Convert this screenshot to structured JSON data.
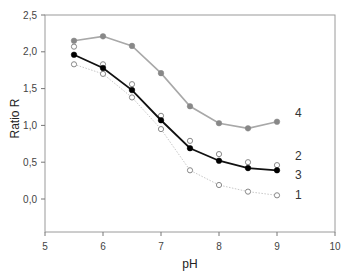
{
  "chart_data": {
    "type": "line",
    "title": "",
    "xlabel": "pH",
    "ylabel": "Ratio R",
    "xlim": [
      5,
      10
    ],
    "ylim": [
      -0.45,
      2.5
    ],
    "xticks": [
      5,
      6,
      7,
      8,
      9,
      10
    ],
    "xtick_labels": [
      "5",
      "6",
      "7",
      "8",
      "9",
      "10"
    ],
    "yticks": [
      0.0,
      0.5,
      1.0,
      1.5,
      2.0,
      2.5
    ],
    "ytick_labels": [
      "0,0",
      "0,5",
      "1,0",
      "1,5",
      "2,0",
      "2,5"
    ],
    "grid": false,
    "legend": "inline labels at right end of each series",
    "x": [
      5.5,
      6.0,
      6.5,
      7.0,
      7.5,
      8.0,
      8.5,
      9.0
    ],
    "series": [
      {
        "name": "1",
        "label": "1",
        "marker": "open-circle",
        "line": "dotted light gray",
        "color": "#c8c8c8",
        "marker_color": "#888888",
        "values": [
          1.83,
          1.7,
          1.38,
          0.95,
          0.39,
          0.19,
          0.1,
          0.05
        ]
      },
      {
        "name": "2",
        "label": "2",
        "marker": "open-circle",
        "line": "none",
        "color": "#888888",
        "marker_color": "#888888",
        "values": [
          2.07,
          1.83,
          1.56,
          1.13,
          0.79,
          0.61,
          0.5,
          0.46
        ]
      },
      {
        "name": "3",
        "label": "3",
        "marker": "filled-circle",
        "line": "solid black",
        "color": "#111111",
        "marker_color": "#000000",
        "values": [
          1.96,
          1.78,
          1.48,
          1.07,
          0.69,
          0.52,
          0.42,
          0.39
        ]
      },
      {
        "name": "4",
        "label": "4",
        "marker": "filled-circle gray",
        "line": "solid gray",
        "color": "#a8a8a8",
        "marker_color": "#888888",
        "values": [
          2.15,
          2.21,
          2.08,
          1.71,
          1.26,
          1.03,
          0.96,
          1.05
        ]
      }
    ]
  },
  "layout": {
    "plot_left": 45,
    "plot_right": 335,
    "plot_top": 15,
    "plot_bottom": 232,
    "y_zero_px": 199,
    "px_per_y": 73.6,
    "px_per_x": 58
  }
}
